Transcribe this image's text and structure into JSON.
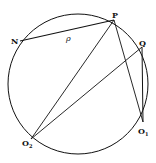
{
  "diagram": {
    "type": "geometry",
    "circle": {
      "cx": 78,
      "cy": 84,
      "r": 70
    },
    "points": {
      "N": {
        "x": 20,
        "y": 41,
        "label": "N"
      },
      "P": {
        "x": 114,
        "y": 20,
        "label": "P"
      },
      "Q": {
        "x": 142,
        "y": 47,
        "label": "Q"
      },
      "O1": {
        "x": 143,
        "y": 122,
        "label": "O",
        "sub": "1"
      },
      "O2": {
        "x": 31,
        "y": 139,
        "label": "O",
        "sub": "2"
      }
    },
    "segments": [
      {
        "from": "N",
        "to": "P",
        "label": "ρ"
      },
      {
        "from": "P",
        "to": "O2"
      },
      {
        "from": "P",
        "to": "O1"
      },
      {
        "from": "Q",
        "to": "O2"
      },
      {
        "from": "Q",
        "to": "O1"
      }
    ],
    "segment_label": "ρ",
    "stroke_color": "#111111",
    "background": "#ffffff"
  }
}
